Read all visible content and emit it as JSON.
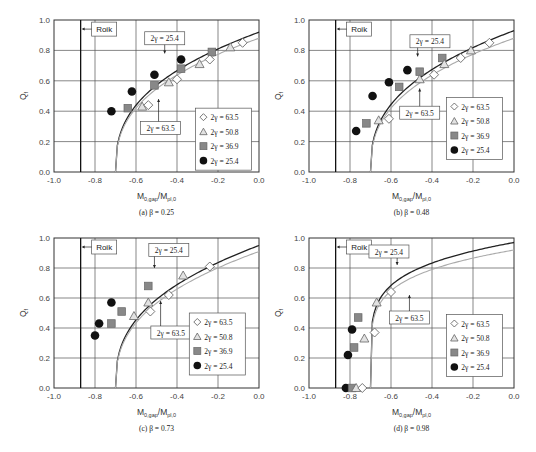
{
  "figure": {
    "panels": [
      {
        "id": "a",
        "caption": "(a) β = 0.25"
      },
      {
        "id": "b",
        "caption": "(b) β = 0.48"
      },
      {
        "id": "c",
        "caption": "(c) β = 0.73"
      },
      {
        "id": "d",
        "caption": "(d) β = 0.98"
      }
    ],
    "xlabel_main": "M",
    "xlabel_sub1": "0,gap",
    "xlabel_mid": "/M",
    "xlabel_sub2": "pl,0",
    "ylabel_main": "Q",
    "ylabel_sub": "f",
    "roik_label": "Roik",
    "curve_label_upper": "2γ = 25.4",
    "curve_label_lower": "2γ = 63.5",
    "legend": [
      "2γ = 63.5",
      "2γ = 50.8",
      "2γ = 36.9",
      "2γ = 25.4"
    ],
    "xticks": [
      "-1.0",
      "-0.8",
      "-0.6",
      "-0.4",
      "-0.2",
      "0.0"
    ],
    "yticks": [
      "0.0",
      "0.2",
      "0.4",
      "0.6",
      "0.8",
      "1.0"
    ]
  },
  "chart_data": [
    {
      "type": "scatter",
      "title": "(a) β = 0.25",
      "xlabel": "M0,gap/Mpl,0",
      "ylabel": "Qf",
      "xlim": [
        -1.0,
        0.0
      ],
      "ylim": [
        0.0,
        1.0
      ],
      "grid": true,
      "legend_position": "lower right",
      "reference_line": {
        "label": "Roik",
        "x": -0.87
      },
      "curves": [
        {
          "name": "2γ = 25.4",
          "color": "#222222",
          "x0": -0.7,
          "y_at_0": 0.92
        },
        {
          "name": "2γ = 63.5",
          "color": "#aaaaaa",
          "x0": -0.7,
          "y_at_0": 0.88
        }
      ],
      "series": [
        {
          "name": "2γ = 63.5",
          "marker": "diamond",
          "points": [
            [
              -0.54,
              0.44
            ],
            [
              -0.4,
              0.61
            ],
            [
              -0.24,
              0.74
            ],
            [
              -0.08,
              0.85
            ]
          ]
        },
        {
          "name": "2γ = 50.8",
          "marker": "triangle",
          "points": [
            [
              -0.57,
              0.43
            ],
            [
              -0.44,
              0.59
            ],
            [
              -0.29,
              0.71
            ],
            [
              -0.14,
              0.82
            ]
          ]
        },
        {
          "name": "2γ = 36.9",
          "marker": "square",
          "points": [
            [
              -0.64,
              0.42
            ],
            [
              -0.51,
              0.57
            ],
            [
              -0.38,
              0.68
            ],
            [
              -0.23,
              0.79
            ]
          ]
        },
        {
          "name": "2γ = 25.4",
          "marker": "circle",
          "points": [
            [
              -0.72,
              0.4
            ],
            [
              -0.62,
              0.53
            ],
            [
              -0.51,
              0.64
            ],
            [
              -0.38,
              0.74
            ]
          ]
        }
      ]
    },
    {
      "type": "scatter",
      "title": "(b) β = 0.48",
      "xlabel": "M0,gap/Mpl,0",
      "ylabel": "Qf",
      "xlim": [
        -1.0,
        0.0
      ],
      "ylim": [
        0.0,
        1.0
      ],
      "grid": true,
      "legend_position": "lower right",
      "reference_line": {
        "label": "Roik",
        "x": -0.87
      },
      "curves": [
        {
          "name": "2γ = 25.4",
          "color": "#222222",
          "x0": -0.7,
          "y_at_0": 0.93
        },
        {
          "name": "2γ = 63.5",
          "color": "#aaaaaa",
          "x0": -0.7,
          "y_at_0": 0.88
        }
      ],
      "series": [
        {
          "name": "2γ = 63.5",
          "marker": "diamond",
          "points": [
            [
              -0.61,
              0.35
            ],
            [
              -0.39,
              0.64
            ],
            [
              -0.26,
              0.75
            ],
            [
              -0.12,
              0.85
            ]
          ]
        },
        {
          "name": "2γ = 50.8",
          "marker": "triangle",
          "points": [
            [
              -0.66,
              0.34
            ],
            [
              -0.46,
              0.61
            ],
            [
              -0.34,
              0.71
            ],
            [
              -0.21,
              0.8
            ]
          ]
        },
        {
          "name": "2γ = 36.9",
          "marker": "square",
          "points": [
            [
              -0.72,
              0.32
            ],
            [
              -0.56,
              0.56
            ],
            [
              -0.46,
              0.66
            ],
            [
              -0.35,
              0.75
            ]
          ]
        },
        {
          "name": "2γ = 25.4",
          "marker": "circle",
          "points": [
            [
              -0.77,
              0.27
            ],
            [
              -0.69,
              0.5
            ],
            [
              -0.61,
              0.59
            ],
            [
              -0.52,
              0.67
            ]
          ]
        }
      ]
    },
    {
      "type": "scatter",
      "title": "(c) β = 0.73",
      "xlabel": "M0,gap/Mpl,0",
      "ylabel": "Qf",
      "xlim": [
        -1.0,
        0.0
      ],
      "ylim": [
        0.0,
        1.0
      ],
      "grid": true,
      "legend_position": "lower right",
      "reference_line": {
        "label": "Roik",
        "x": -0.87
      },
      "curves": [
        {
          "name": "2γ = 25.4",
          "color": "#222222",
          "x0": -0.7,
          "y_at_0": 0.95
        },
        {
          "name": "2γ = 63.5",
          "color": "#aaaaaa",
          "x0": -0.7,
          "y_at_0": 0.91
        }
      ],
      "series": [
        {
          "name": "2γ = 63.5",
          "marker": "diamond",
          "points": [
            [
              -0.53,
              0.51
            ],
            [
              -0.44,
              0.62
            ],
            [
              -0.24,
              0.81
            ]
          ]
        },
        {
          "name": "2γ = 50.8",
          "marker": "triangle",
          "points": [
            [
              -0.61,
              0.48
            ],
            [
              -0.54,
              0.57
            ],
            [
              -0.37,
              0.75
            ]
          ]
        },
        {
          "name": "2γ = 36.9",
          "marker": "square",
          "points": [
            [
              -0.72,
              0.43
            ],
            [
              -0.67,
              0.51
            ],
            [
              -0.54,
              0.68
            ]
          ]
        },
        {
          "name": "2γ = 25.4",
          "marker": "circle",
          "points": [
            [
              -0.8,
              0.35
            ],
            [
              -0.78,
              0.43
            ],
            [
              -0.72,
              0.57
            ]
          ]
        }
      ]
    },
    {
      "type": "scatter",
      "title": "(d) β = 0.98",
      "xlabel": "M0,gap/Mpl,0",
      "ylabel": "Qf",
      "xlim": [
        -1.0,
        0.0
      ],
      "ylim": [
        0.0,
        1.0
      ],
      "grid": true,
      "legend_position": "lower right",
      "reference_line": {
        "label": "Roik",
        "x": -0.87
      },
      "curves": [
        {
          "name": "2γ = 25.4",
          "color": "#222222",
          "x0": -0.7,
          "y_at_0": 0.97
        },
        {
          "name": "2γ = 63.5",
          "color": "#aaaaaa",
          "x0": -0.7,
          "y_at_0": 0.92
        }
      ],
      "series": [
        {
          "name": "2γ = 63.5",
          "marker": "diamond",
          "points": [
            [
              -0.74,
              0.0
            ],
            [
              -0.68,
              0.37
            ],
            [
              -0.6,
              0.64
            ]
          ]
        },
        {
          "name": "2γ = 50.8",
          "marker": "triangle",
          "points": [
            [
              -0.77,
              0.0
            ],
            [
              -0.73,
              0.33
            ],
            [
              -0.67,
              0.57
            ]
          ]
        },
        {
          "name": "2γ = 36.9",
          "marker": "square",
          "points": [
            [
              -0.79,
              0.0
            ],
            [
              -0.78,
              0.27
            ],
            [
              -0.76,
              0.47
            ]
          ]
        },
        {
          "name": "2γ = 25.4",
          "marker": "circle",
          "points": [
            [
              -0.82,
              0.0
            ],
            [
              -0.81,
              0.22
            ],
            [
              -0.79,
              0.39
            ]
          ]
        }
      ]
    }
  ]
}
